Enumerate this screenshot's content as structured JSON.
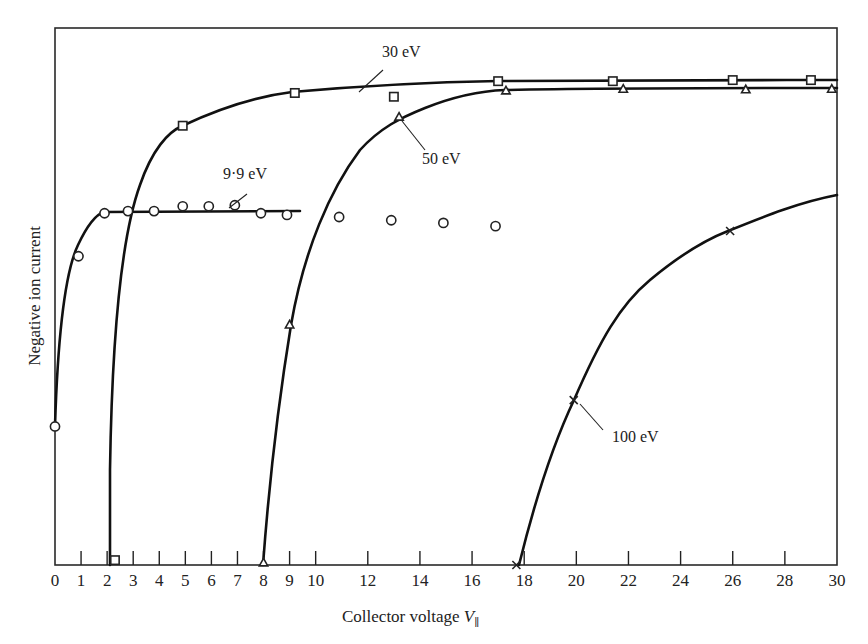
{
  "chart_data": {
    "type": "scatter",
    "title": "",
    "xlabel": "Collector voltage V_∥",
    "xlabel_main": "Collector voltage ",
    "xlabel_var": "V",
    "xlabel_sub": "∥",
    "ylabel": "Negative ion current",
    "xlim": [
      0,
      30
    ],
    "ylim": [
      0,
      1
    ],
    "y_units": "arbitrary (no tick labels)",
    "grid": false,
    "legend_position": "inline annotations",
    "x_ticks": [
      0,
      1,
      2,
      3,
      4,
      5,
      6,
      7,
      8,
      9,
      10,
      12,
      14,
      16,
      18,
      20,
      22,
      24,
      26,
      28,
      30
    ],
    "x_tick_labels": [
      "0",
      "1",
      "2",
      "3",
      "4",
      "5",
      "6",
      "7",
      "8",
      "9",
      "10",
      "12",
      "14",
      "16",
      "18",
      "20",
      "22",
      "24",
      "26",
      "28",
      "30"
    ],
    "series": [
      {
        "name": "9·9 eV",
        "marker": "circle",
        "fit_line": "rises steeply from 0, flat plateau ~0.65 from x≈2 to x≈9.3",
        "x": [
          0,
          0.9,
          1.9,
          2.8,
          3.8,
          4.9,
          5.9,
          6.9,
          7.9,
          8.9,
          10.9,
          12.9,
          14.9,
          16.9
        ],
        "y": [
          0.258,
          0.575,
          0.655,
          0.659,
          0.659,
          0.668,
          0.668,
          0.67,
          0.655,
          0.652,
          0.648,
          0.642,
          0.637,
          0.631
        ]
      },
      {
        "name": "30 eV",
        "marker": "square",
        "fit_line": "vertical rise at x≈2.1, saturating ~0.90-0.91",
        "x": [
          2.3,
          4.9,
          9.2,
          13.0,
          17.0,
          21.4,
          26.0,
          29.0
        ],
        "y": [
          0.009,
          0.818,
          0.879,
          0.872,
          0.901,
          0.901,
          0.903,
          0.903
        ]
      },
      {
        "name": "50 eV",
        "marker": "triangle",
        "fit_line": "starts at x≈8, saturates ~0.885",
        "x": [
          8.0,
          9.0,
          13.2,
          17.3,
          21.8,
          26.5,
          29.8
        ],
        "y": [
          0.004,
          0.447,
          0.834,
          0.883,
          0.886,
          0.885,
          0.886
        ]
      },
      {
        "name": "100 eV",
        "marker": "cross",
        "fit_line": "starts at x≈17.8, rises to ~0.69 at x=30",
        "x": [
          17.7,
          19.9,
          25.9
        ],
        "y": [
          0.0,
          0.307,
          0.622
        ]
      }
    ],
    "annotations": [
      {
        "text": "30 eV",
        "x": 13.2,
        "y": 0.96
      },
      {
        "text": "50 eV",
        "x": 15.0,
        "y": 0.76
      },
      {
        "text": "9·9 eV",
        "x": 7.2,
        "y": 0.74
      },
      {
        "text": "100 eV",
        "x": 22.0,
        "y": 0.24
      }
    ]
  },
  "labels": {
    "annot_30": "30 eV",
    "annot_50": "50 eV",
    "annot_99": "9·9 eV",
    "annot_100": "100 eV",
    "ylabel": "Negative ion current",
    "xlabel_main": "Collector voltage ",
    "xlabel_var": "V",
    "xlabel_sub": "∥"
  }
}
